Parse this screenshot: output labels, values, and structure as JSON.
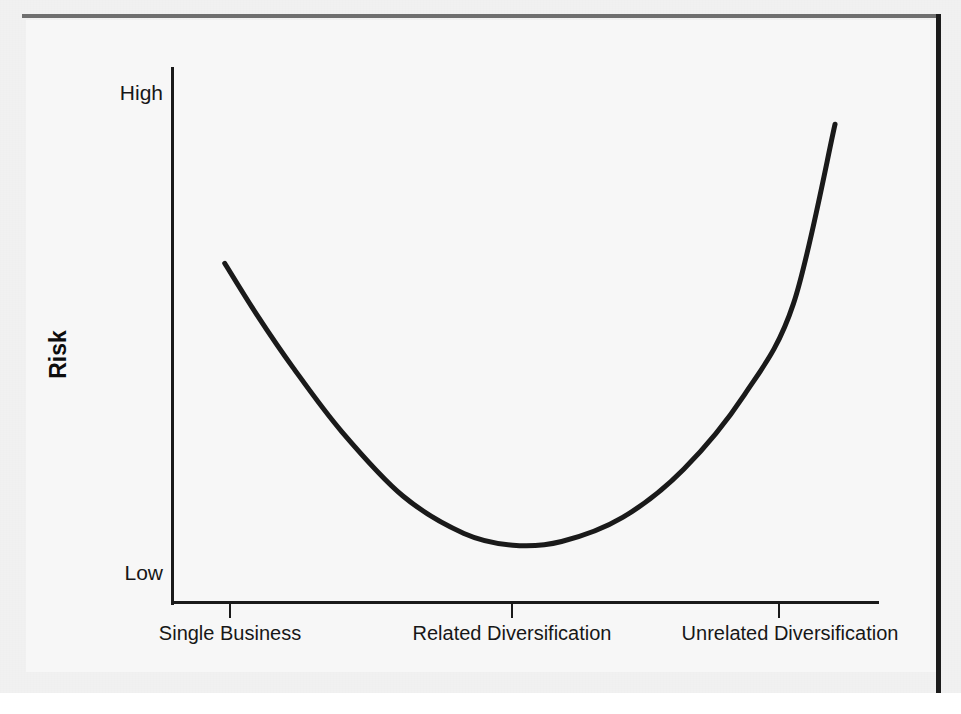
{
  "figure": {
    "background_color": "#f1f1f1",
    "plate_color": "#f7f7f7",
    "ink_color": "#1a1a1a",
    "border_top_color": "#6f6f6f",
    "border_right_color": "#1c1c1c"
  },
  "chart_data": {
    "type": "line",
    "title": "",
    "subtitle": "",
    "xlabel": "",
    "ylabel": "Risk",
    "grid": false,
    "legend": null,
    "annotations": [],
    "x_tick_labels": [
      "Single Business",
      "Related Diversification",
      "Unrelated Diversification"
    ],
    "x_tick_positions": [
      1,
      2,
      3
    ],
    "y_tick_labels": [
      "Low",
      "High"
    ],
    "y_tick_positions": [
      0,
      100
    ],
    "xlim": [
      0.6,
      3.5
    ],
    "ylim": [
      0,
      100
    ],
    "series": [
      {
        "name": "Risk",
        "x": [
          0.82,
          0.95,
          1.1,
          1.3,
          1.55,
          1.8,
          2.0,
          2.2,
          2.45,
          2.7,
          2.95,
          3.15,
          3.32
        ],
        "y": [
          63.5,
          54.0,
          44.0,
          32.0,
          20.0,
          13.0,
          10.8,
          11.5,
          16.0,
          25.0,
          39.0,
          56.0,
          89.5
        ]
      }
    ]
  },
  "axis": {
    "y_title": "Risk",
    "y_high_label": "High",
    "y_low_label": "Low",
    "x_labels": [
      "Single Business",
      "Related Diversification",
      "Unrelated Diversification"
    ]
  }
}
